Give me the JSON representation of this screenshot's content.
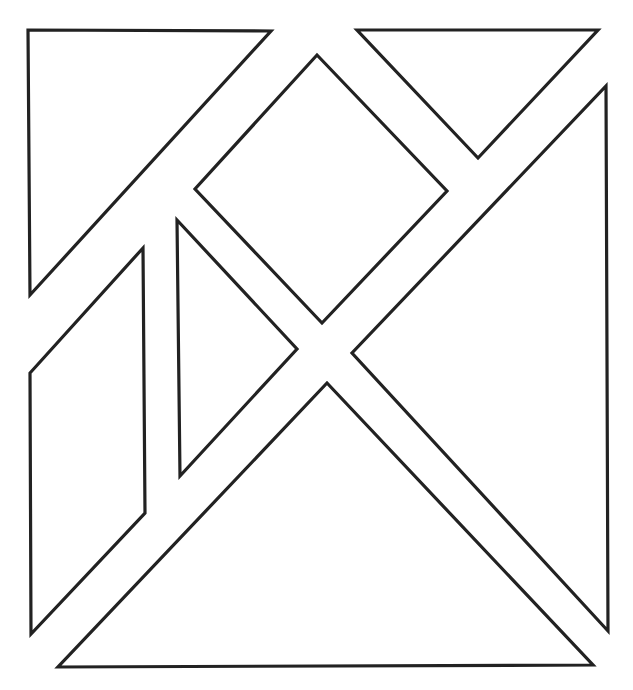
{
  "diagram": {
    "type": "tangram-outline",
    "width": 633,
    "height": 690,
    "background": "#ffffff",
    "stroke_color": "#222222",
    "pieces": [
      {
        "name": "large-triangle-top-left",
        "points": "28,30 271,31 30,295"
      },
      {
        "name": "small-triangle-top-right",
        "points": "357,30 598,30 478,158"
      },
      {
        "name": "square-diamond",
        "points": "317,55 447,191 322,323 195,189"
      },
      {
        "name": "large-triangle-right",
        "points": "606,86 608,631 352,353"
      },
      {
        "name": "small-triangle-middle",
        "points": "177,220 297,349 180,476"
      },
      {
        "name": "parallelogram-left",
        "points": "143,248 145,513 31,634 30,373"
      },
      {
        "name": "large-triangle-bottom",
        "points": "327,383 593,665 58,667"
      }
    ]
  }
}
